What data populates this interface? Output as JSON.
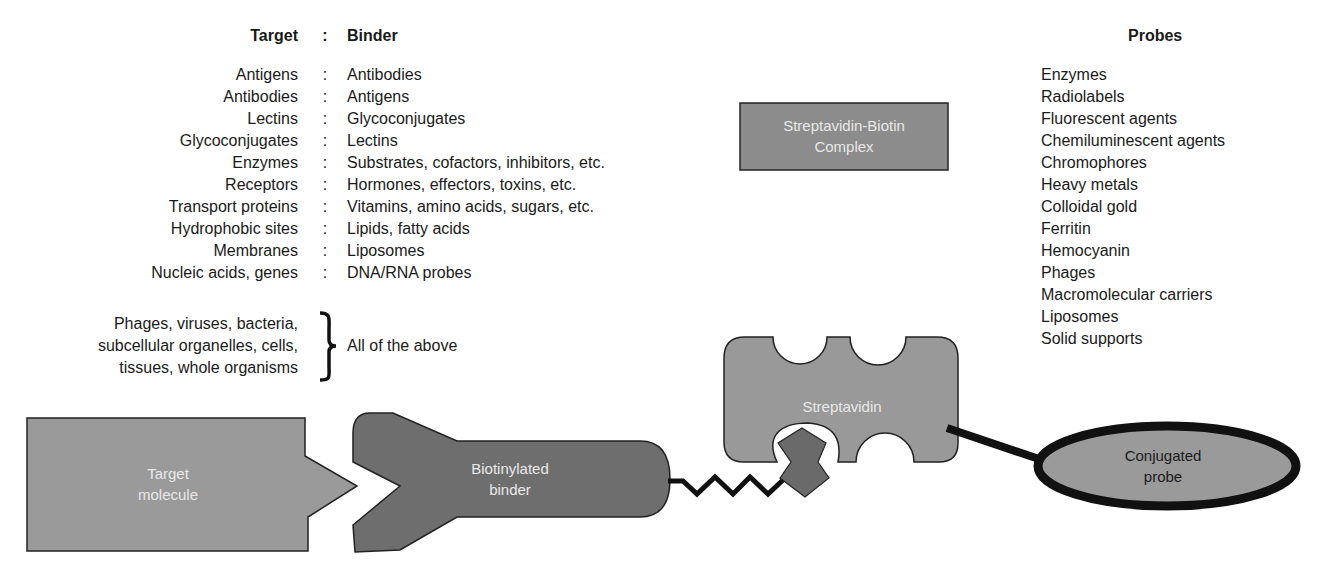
{
  "headers": {
    "target": "Target",
    "colon": ":",
    "binder": "Binder",
    "probes": "Probes"
  },
  "pairs": [
    {
      "target": "Antigens",
      "binder": "Antibodies"
    },
    {
      "target": "Antibodies",
      "binder": "Antigens"
    },
    {
      "target": "Lectins",
      "binder": "Glycoconjugates"
    },
    {
      "target": "Glycoconjugates",
      "binder": "Lectins"
    },
    {
      "target": "Enzymes",
      "binder": "Substrates, cofactors, inhibitors, etc."
    },
    {
      "target": "Receptors",
      "binder": "Hormones, effectors, toxins, etc."
    },
    {
      "target": "Transport proteins",
      "binder": "Vitamins, amino acids, sugars, etc."
    },
    {
      "target": "Hydrophobic sites",
      "binder": "Lipids, fatty acids"
    },
    {
      "target": "Membranes",
      "binder": "Liposomes"
    },
    {
      "target": "Nucleic acids, genes",
      "binder": "DNA/RNA probes"
    }
  ],
  "group": {
    "lines": [
      "Phages, viruses, bacteria,",
      "subcellular organelles, cells,",
      "tissues, whole organisms"
    ],
    "binder": "All of the above"
  },
  "probes": [
    "Enzymes",
    "Radiolabels",
    "Fluorescent agents",
    "Chemiluminescent agents",
    "Chromophores",
    "Heavy metals",
    "Colloidal gold",
    "Ferritin",
    "Hemocyanin",
    "Phages",
    "Macromolecular carriers",
    "Liposomes",
    "Solid supports"
  ],
  "complex_box": {
    "line1": "Streptavidin-Biotin",
    "line2": "Complex"
  },
  "shapes": {
    "target_molecule": {
      "line1": "Target",
      "line2": "molecule"
    },
    "biotinylated_binder": {
      "line1": "Biotinylated",
      "line2": "binder"
    },
    "streptavidin": {
      "label": "Streptavidin"
    },
    "conjugated_probe": {
      "line1": "Conjugated",
      "line2": "probe"
    }
  },
  "colors": {
    "target_fill": "#9a9a9a",
    "binder_fill": "#6e6e6e",
    "streptavidin_fill": "#999999",
    "biotin_fill": "#6a6a6a",
    "probe_fill": "#9a9a9a",
    "complex_box_fill": "#8c8c8c",
    "outline": "#111111"
  }
}
